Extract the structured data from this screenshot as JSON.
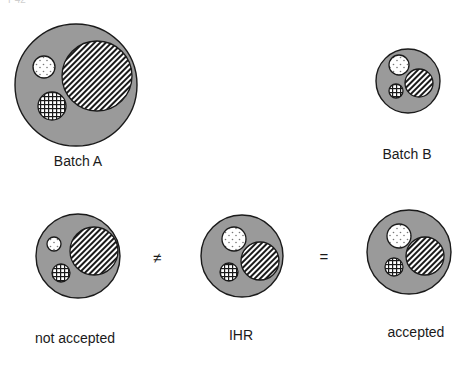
{
  "corner_label": "P42",
  "colors": {
    "outer_fill": "#9a9a9a",
    "outline": "#1a1a1a",
    "inner_bg": "#ffffff"
  },
  "groups": [
    {
      "id": "batch-a",
      "label": "Batch A",
      "label_pos": [
        78,
        162
      ],
      "outer": {
        "cx": 76,
        "cy": 85,
        "r": 61
      },
      "particles": [
        {
          "type": "hatched",
          "cx": 97,
          "cy": 76,
          "r": 35
        },
        {
          "type": "dotted",
          "cx": 44,
          "cy": 67,
          "r": 11
        },
        {
          "type": "grid",
          "cx": 52,
          "cy": 106,
          "r": 14
        }
      ]
    },
    {
      "id": "batch-b",
      "label": "Batch B",
      "label_pos": [
        407,
        155
      ],
      "outer": {
        "cx": 408,
        "cy": 81,
        "r": 32
      },
      "particles": [
        {
          "type": "hatched",
          "cx": 419,
          "cy": 83,
          "r": 14
        },
        {
          "type": "dotted",
          "cx": 399,
          "cy": 65,
          "r": 10
        },
        {
          "type": "grid",
          "cx": 396,
          "cy": 91,
          "r": 7
        }
      ]
    },
    {
      "id": "not-accepted",
      "label": "not accepted",
      "label_pos": [
        75,
        339
      ],
      "outer": {
        "cx": 78,
        "cy": 256,
        "r": 42
      },
      "particles": [
        {
          "type": "hatched",
          "cx": 94,
          "cy": 251,
          "r": 24
        },
        {
          "type": "dotted",
          "cx": 54,
          "cy": 244,
          "r": 7
        },
        {
          "type": "grid",
          "cx": 61,
          "cy": 273,
          "r": 9
        }
      ]
    },
    {
      "id": "ihr",
      "label": "IHR",
      "label_pos": [
        241,
        336
      ],
      "outer": {
        "cx": 242,
        "cy": 256,
        "r": 41
      },
      "particles": [
        {
          "type": "hatched",
          "cx": 260,
          "cy": 261,
          "r": 19
        },
        {
          "type": "dotted",
          "cx": 234,
          "cy": 239,
          "r": 12
        },
        {
          "type": "grid",
          "cx": 229,
          "cy": 272,
          "r": 9
        }
      ]
    },
    {
      "id": "accepted",
      "label": "accepted",
      "label_pos": [
        416,
        333
      ],
      "outer": {
        "cx": 409,
        "cy": 252,
        "r": 42
      },
      "particles": [
        {
          "type": "hatched",
          "cx": 425,
          "cy": 256,
          "r": 19
        },
        {
          "type": "dotted",
          "cx": 399,
          "cy": 236,
          "r": 12
        },
        {
          "type": "grid",
          "cx": 394,
          "cy": 267,
          "r": 9
        }
      ]
    }
  ],
  "operators": [
    {
      "symbol": "≠",
      "x": 157,
      "y": 257
    },
    {
      "symbol": "=",
      "x": 324,
      "y": 256
    }
  ]
}
